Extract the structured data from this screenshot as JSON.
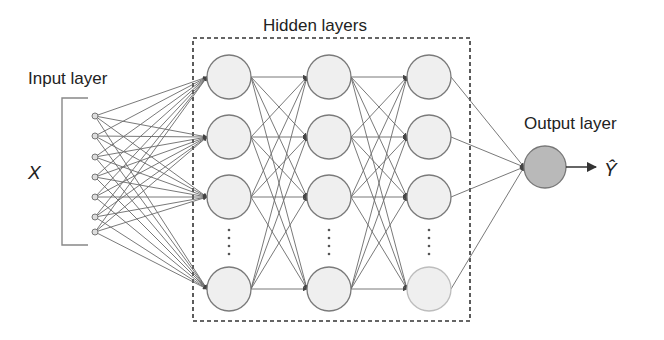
{
  "labels": {
    "input_layer": "Input layer",
    "hidden_layers": "Hidden layers",
    "output_layer": "Output layer",
    "input_var": "X",
    "output_var": "Ŷ"
  },
  "layers": {
    "input": {
      "count": 7,
      "x": 95,
      "ys": [
        116,
        136,
        157,
        177,
        197,
        217,
        232
      ],
      "r": 3
    },
    "hidden": {
      "columns_x": [
        229,
        329,
        429
      ],
      "rows_y": [
        77,
        137,
        197,
        289
      ],
      "r": 22,
      "ellipsis_y": [
        230,
        238,
        246,
        254
      ]
    },
    "output": {
      "x": 545,
      "y": 167,
      "r": 21
    }
  },
  "colors": {
    "node_fill": "#efefef",
    "node_stroke": "#7a7a7a",
    "faded_stroke": "#bdbdbd",
    "output_fill": "#b9b9b9",
    "edge": "#6a6a6a",
    "box": "#333333",
    "bracket": "#888888"
  },
  "box": {
    "x": 193,
    "y": 38,
    "w": 277,
    "h": 283
  },
  "bracket": {
    "x": 62,
    "top": 98,
    "bottom": 245,
    "tick_end": 88
  }
}
